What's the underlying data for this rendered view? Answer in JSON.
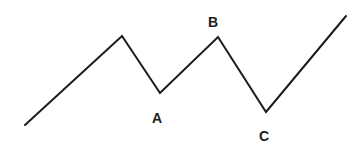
{
  "figure": {
    "background_color": "#ffffff",
    "line_color": "#1c1c1c",
    "line_width": 2,
    "width": 361,
    "height": 148
  },
  "chart_data": {
    "type": "line",
    "xlabel": "",
    "ylabel": "",
    "grid": false,
    "legend": null,
    "axes_visible": false,
    "xlim": [
      0,
      361
    ],
    "ylim": [
      0,
      148
    ],
    "y_axis_inverted": true,
    "series": [
      {
        "name": "price-path",
        "color": "#1c1c1c",
        "width": 2,
        "x": [
          25,
          122,
          160,
          218,
          266,
          346
        ],
        "y": [
          125,
          36,
          93,
          37,
          112,
          16
        ],
        "points": [
          {
            "label": "",
            "x": 25,
            "y": 125,
            "role": "start"
          },
          {
            "label": "",
            "x": 122,
            "y": 36,
            "role": "peak"
          },
          {
            "label": "A",
            "x": 160,
            "y": 93,
            "role": "trough"
          },
          {
            "label": "B",
            "x": 218,
            "y": 37,
            "role": "peak"
          },
          {
            "label": "C",
            "x": 266,
            "y": 112,
            "role": "trough"
          },
          {
            "label": "",
            "x": 346,
            "y": 16,
            "role": "end"
          }
        ]
      }
    ],
    "annotations": [
      {
        "text": "A",
        "x": 157,
        "y": 118
      },
      {
        "text": "B",
        "x": 213,
        "y": 22
      },
      {
        "text": "C",
        "x": 264,
        "y": 136
      }
    ]
  }
}
